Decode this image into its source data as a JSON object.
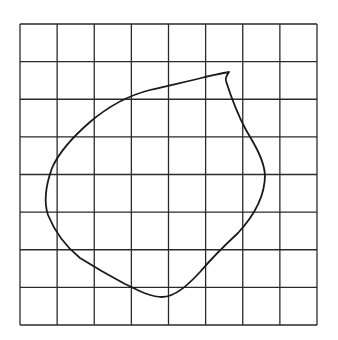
{
  "figure": {
    "grid": {
      "columns": 8,
      "rows": 8,
      "left": 20,
      "top": 24,
      "right": 317,
      "bottom": 325,
      "line_color": "#2a2a2a",
      "line_width": 1.3
    },
    "curve": {
      "color": "#1a1a1a",
      "stroke_width": 1.8,
      "path": "M 229 72 C 227 75, 225 77, 226 81 C 232 100, 238 115, 246 130 C 255 145, 264 160, 265 175 C 265 200, 250 220, 238 233 C 225 245, 212 258, 200 272 C 188 285, 175 297, 162 297 C 150 297, 138 290, 125 284 C 110 276, 96 268, 80 258 C 65 246, 55 232, 48 215 C 43 200, 47 182, 52 168 C 60 150, 75 135, 90 122 C 110 105, 130 95, 150 90 C 170 85, 190 81, 205 77 C 215 75, 222 73, 229 72 Z"
    }
  }
}
